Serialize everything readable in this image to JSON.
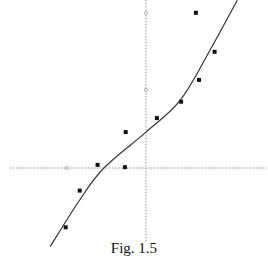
{
  "caption": "Fig. 1.5",
  "colors": {
    "axis": "#9a9a9a",
    "curve": "#333333",
    "points": "#111111",
    "background": "#ffffff"
  },
  "chart_data": {
    "type": "scatter",
    "title": "",
    "caption": "Fig. 1.5",
    "xlabel": "",
    "ylabel": "",
    "grid": false,
    "legend": null,
    "axes": {
      "style": "dotted",
      "origin_px": [
        146,
        168
      ],
      "x_tick_px": [
        67
      ],
      "y_tick_px": [
        90,
        13
      ]
    },
    "units_note": "values in tick units: 1 unit ≈ 78px horizontally, ≈ 78px vertically",
    "points": [
      {
        "x": -1.03,
        "y": -0.76
      },
      {
        "x": -0.85,
        "y": -0.29
      },
      {
        "x": -0.62,
        "y": 0.04
      },
      {
        "x": -0.27,
        "y": 0.01
      },
      {
        "x": -0.26,
        "y": 0.46
      },
      {
        "x": 0.14,
        "y": 0.64
      },
      {
        "x": 0.45,
        "y": 0.85
      },
      {
        "x": 0.68,
        "y": 1.13
      },
      {
        "x": 0.88,
        "y": 1.49
      },
      {
        "x": 0.64,
        "y": 1.99
      }
    ],
    "fit_curve": {
      "description": "smooth increasing S-shaped fitted curve",
      "points": [
        {
          "x": -1.23,
          "y": -1.01
        },
        {
          "x": -0.85,
          "y": -0.41
        },
        {
          "x": -0.54,
          "y": 0.0
        },
        {
          "x": 0.0,
          "y": 0.46
        },
        {
          "x": 0.44,
          "y": 0.87
        },
        {
          "x": 0.82,
          "y": 1.51
        },
        {
          "x": 1.17,
          "y": 2.15
        }
      ]
    }
  }
}
